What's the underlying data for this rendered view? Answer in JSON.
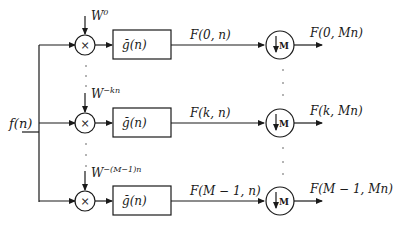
{
  "diagram": {
    "type": "filter bank block diagram (DFT analysis filter bank with decimation)",
    "input": {
      "label": "f(n)"
    },
    "branches": [
      {
        "index": "0",
        "modulator": "W",
        "modulator_exp": "0",
        "multiplier_symbol": "×",
        "filter": "ğ(n)",
        "filter_output": "F(0, n)",
        "downsampler": "M",
        "output": "F(0, Mn)"
      },
      {
        "index": "k",
        "modulator": "W",
        "modulator_exp": "−kn",
        "multiplier_symbol": "×",
        "filter": "ğ(n)",
        "filter_output": "F(k, n)",
        "downsampler": "M",
        "output": "F(k, Mn)"
      },
      {
        "index": "M−1",
        "modulator": "W",
        "modulator_exp": "−(M−1)n",
        "multiplier_symbol": "×",
        "filter": "ğ(n)",
        "filter_output": "F(M − 1, n)",
        "downsampler": "M",
        "output": "F(M − 1,  Mn)"
      }
    ],
    "ellipsis": "⋮",
    "colors": {
      "stroke": "#1a1a1a",
      "background": "#ffffff"
    }
  }
}
